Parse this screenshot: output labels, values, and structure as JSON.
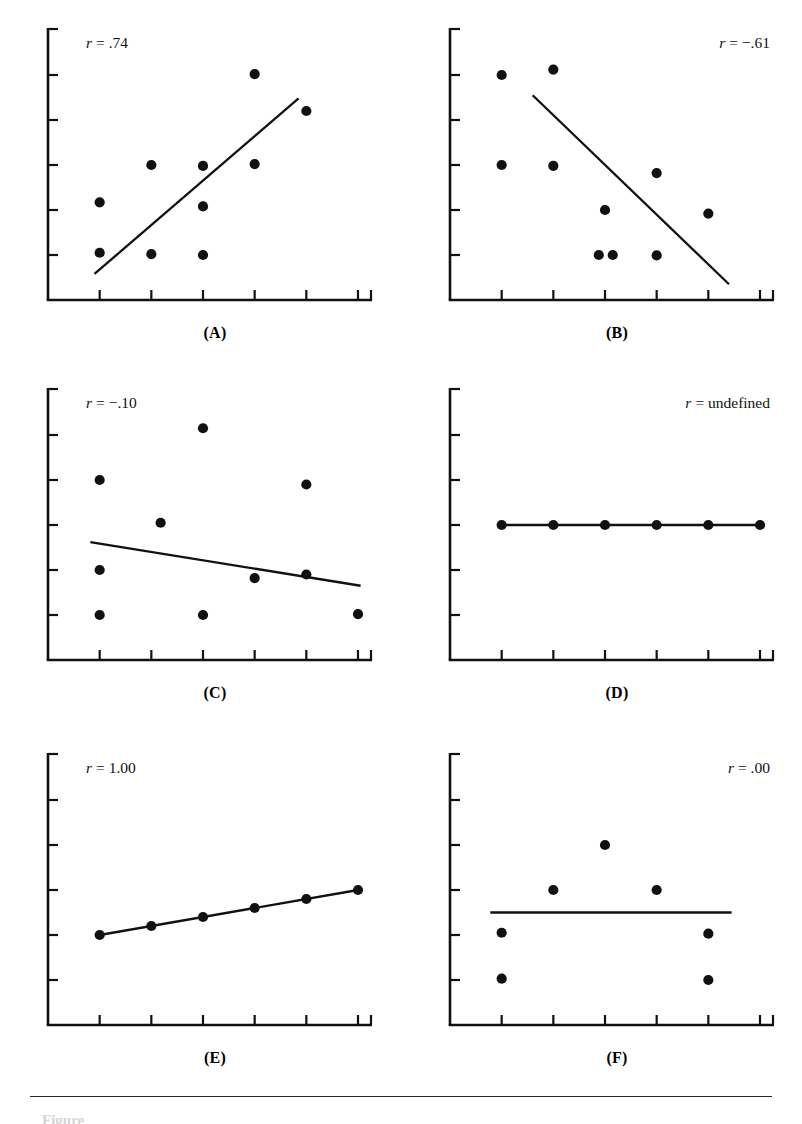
{
  "figure": {
    "background": "#ffffff",
    "ink": "#111111",
    "caption_partial": "Figure",
    "panel_count": 6
  },
  "chart_data": [
    {
      "id": "A",
      "type": "scatter",
      "title": "",
      "panel_label": "(A)",
      "annotation": "r = .74",
      "annotation_r": "r",
      "annotation_rest": "= .74",
      "annotation_align": "left",
      "correlation": 0.74,
      "xlabel": "",
      "ylabel": "",
      "xlim": [
        0,
        6
      ],
      "ylim": [
        0,
        6
      ],
      "grid": false,
      "legend": "none",
      "x_ticks": [
        1,
        2,
        3,
        4,
        5,
        6
      ],
      "y_ticks": [
        1,
        2,
        3,
        4,
        5
      ],
      "points": [
        {
          "x": 1,
          "y": 1.05
        },
        {
          "x": 1,
          "y": 2.17
        },
        {
          "x": 2,
          "y": 1.02
        },
        {
          "x": 2,
          "y": 3.0
        },
        {
          "x": 3,
          "y": 1.0
        },
        {
          "x": 3,
          "y": 2.08
        },
        {
          "x": 3,
          "y": 2.98
        },
        {
          "x": 4,
          "y": 5.02
        },
        {
          "x": 4,
          "y": 3.02
        },
        {
          "x": 5,
          "y": 4.2
        }
      ],
      "fit_line": {
        "x1": 0.9,
        "y1": 0.58,
        "x2": 4.85,
        "y2": 4.48
      }
    },
    {
      "id": "B",
      "type": "scatter",
      "title": "",
      "panel_label": "(B)",
      "annotation": "r = -.61",
      "annotation_r": "r",
      "annotation_rest": "= −.61",
      "annotation_align": "right",
      "correlation": -0.61,
      "xlabel": "",
      "ylabel": "",
      "xlim": [
        0,
        6
      ],
      "ylim": [
        0,
        6
      ],
      "grid": false,
      "legend": "none",
      "x_ticks": [
        1,
        2,
        3,
        4,
        5,
        6
      ],
      "y_ticks": [
        1,
        2,
        3,
        4,
        5
      ],
      "points": [
        {
          "x": 1,
          "y": 5.0
        },
        {
          "x": 2,
          "y": 5.12
        },
        {
          "x": 1,
          "y": 3.0
        },
        {
          "x": 2,
          "y": 2.98
        },
        {
          "x": 4,
          "y": 2.82
        },
        {
          "x": 3,
          "y": 2.0
        },
        {
          "x": 5,
          "y": 1.92
        },
        {
          "x": 2.88,
          "y": 1.0
        },
        {
          "x": 3.15,
          "y": 1.0
        },
        {
          "x": 4,
          "y": 0.99
        }
      ],
      "fit_line": {
        "x1": 1.6,
        "y1": 4.55,
        "x2": 5.4,
        "y2": 0.35
      }
    },
    {
      "id": "C",
      "type": "scatter",
      "title": "",
      "panel_label": "(C)",
      "annotation": "r = -.10",
      "annotation_r": "r",
      "annotation_rest": "= −.10",
      "annotation_align": "left",
      "correlation": -0.1,
      "xlabel": "",
      "ylabel": "",
      "xlim": [
        0,
        6
      ],
      "ylim": [
        0,
        6
      ],
      "grid": false,
      "legend": "none",
      "x_ticks": [
        1,
        2,
        3,
        4,
        5,
        6
      ],
      "y_ticks": [
        1,
        2,
        3,
        4,
        5
      ],
      "points": [
        {
          "x": 3,
          "y": 5.15
        },
        {
          "x": 1,
          "y": 4.0
        },
        {
          "x": 5,
          "y": 3.9
        },
        {
          "x": 2.18,
          "y": 3.05
        },
        {
          "x": 1,
          "y": 2.0
        },
        {
          "x": 4,
          "y": 1.82
        },
        {
          "x": 5,
          "y": 1.9
        },
        {
          "x": 1,
          "y": 1.0
        },
        {
          "x": 3,
          "y": 1.0
        },
        {
          "x": 6,
          "y": 1.02
        }
      ],
      "fit_line": {
        "x1": 0.82,
        "y1": 2.62,
        "x2": 6.05,
        "y2": 1.65
      }
    },
    {
      "id": "D",
      "type": "scatter",
      "title": "",
      "panel_label": "(D)",
      "annotation": "r = undefined",
      "annotation_r": "r",
      "annotation_rest": "= undefined",
      "annotation_align": "right",
      "correlation": null,
      "xlabel": "",
      "ylabel": "",
      "xlim": [
        0,
        6
      ],
      "ylim": [
        0,
        6
      ],
      "grid": false,
      "legend": "none",
      "x_ticks": [
        1,
        2,
        3,
        4,
        5,
        6
      ],
      "y_ticks": [
        1,
        2,
        3,
        4,
        5
      ],
      "points": [
        {
          "x": 1,
          "y": 3.0
        },
        {
          "x": 2,
          "y": 3.0
        },
        {
          "x": 3,
          "y": 3.0
        },
        {
          "x": 4,
          "y": 3.0
        },
        {
          "x": 5,
          "y": 3.0
        },
        {
          "x": 6,
          "y": 3.0
        }
      ],
      "fit_line": {
        "x1": 1,
        "y1": 3.0,
        "x2": 6,
        "y2": 3.0
      }
    },
    {
      "id": "E",
      "type": "scatter",
      "title": "",
      "panel_label": "(E)",
      "annotation": "r = 1.00",
      "annotation_r": "r",
      "annotation_rest": "= 1.00",
      "annotation_align": "left",
      "correlation": 1.0,
      "xlabel": "",
      "ylabel": "",
      "xlim": [
        0,
        6
      ],
      "ylim": [
        0,
        6
      ],
      "grid": false,
      "legend": "none",
      "x_ticks": [
        1,
        2,
        3,
        4,
        5,
        6
      ],
      "y_ticks": [
        1,
        2,
        3,
        4,
        5
      ],
      "points": [
        {
          "x": 1,
          "y": 2.0
        },
        {
          "x": 2,
          "y": 2.2
        },
        {
          "x": 3,
          "y": 2.4
        },
        {
          "x": 4,
          "y": 2.6
        },
        {
          "x": 5,
          "y": 2.8
        },
        {
          "x": 6,
          "y": 3.0
        }
      ],
      "fit_line": {
        "x1": 1,
        "y1": 2.0,
        "x2": 6,
        "y2": 3.0
      }
    },
    {
      "id": "F",
      "type": "scatter",
      "title": "",
      "panel_label": "(F)",
      "annotation": "r = .00",
      "annotation_r": "r",
      "annotation_rest": "= .00",
      "annotation_align": "right",
      "correlation": 0.0,
      "xlabel": "",
      "ylabel": "",
      "xlim": [
        0,
        6
      ],
      "ylim": [
        0,
        6
      ],
      "grid": false,
      "legend": "none",
      "x_ticks": [
        1,
        2,
        3,
        4,
        5,
        6
      ],
      "y_ticks": [
        1,
        2,
        3,
        4,
        5
      ],
      "points": [
        {
          "x": 3,
          "y": 4.0
        },
        {
          "x": 2,
          "y": 3.0
        },
        {
          "x": 4,
          "y": 3.0
        },
        {
          "x": 1,
          "y": 2.05
        },
        {
          "x": 5,
          "y": 2.03
        },
        {
          "x": 1,
          "y": 1.03
        },
        {
          "x": 5,
          "y": 1.0
        }
      ],
      "fit_line": {
        "x1": 0.78,
        "y1": 2.5,
        "x2": 5.45,
        "y2": 2.5
      }
    }
  ]
}
